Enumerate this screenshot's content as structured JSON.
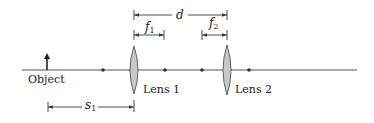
{
  "diagram": {
    "type": "optical-two-lens-system",
    "colors": {
      "line": "#3a3a3a",
      "lens_fill": "#c8c8c8",
      "lens_stroke": "#555555",
      "text": "#222222"
    },
    "labels": {
      "object": "Object",
      "lens1": "Lens 1",
      "lens2": "Lens 2",
      "d": "d",
      "f1_main": "f",
      "f1_sub": "1",
      "f2_main": "f",
      "f2_sub": "2",
      "s1_main": "s",
      "s1_sub": "1"
    },
    "elements": {
      "optical_axis": {
        "x1": 22,
        "x2": 357,
        "y": 70
      },
      "object_arrow": {
        "x": 47,
        "y_base": 70,
        "y_tip": 54
      },
      "lens1": {
        "cx": 134,
        "cy": 70,
        "rx": 5,
        "ry": 24
      },
      "lens2": {
        "cx": 227,
        "cy": 70,
        "rx": 5,
        "ry": 25
      },
      "focal_points": [
        103,
        165,
        202,
        249
      ],
      "dimension_d": {
        "x1": 134,
        "x2": 227,
        "y": 15
      },
      "dimension_f1": {
        "x1": 134,
        "x2": 164,
        "y": 35
      },
      "dimension_f2": {
        "x1": 202,
        "x2": 227,
        "y": 35
      },
      "dimension_s1": {
        "x1": 48,
        "x2": 134,
        "y": 107
      }
    }
  }
}
